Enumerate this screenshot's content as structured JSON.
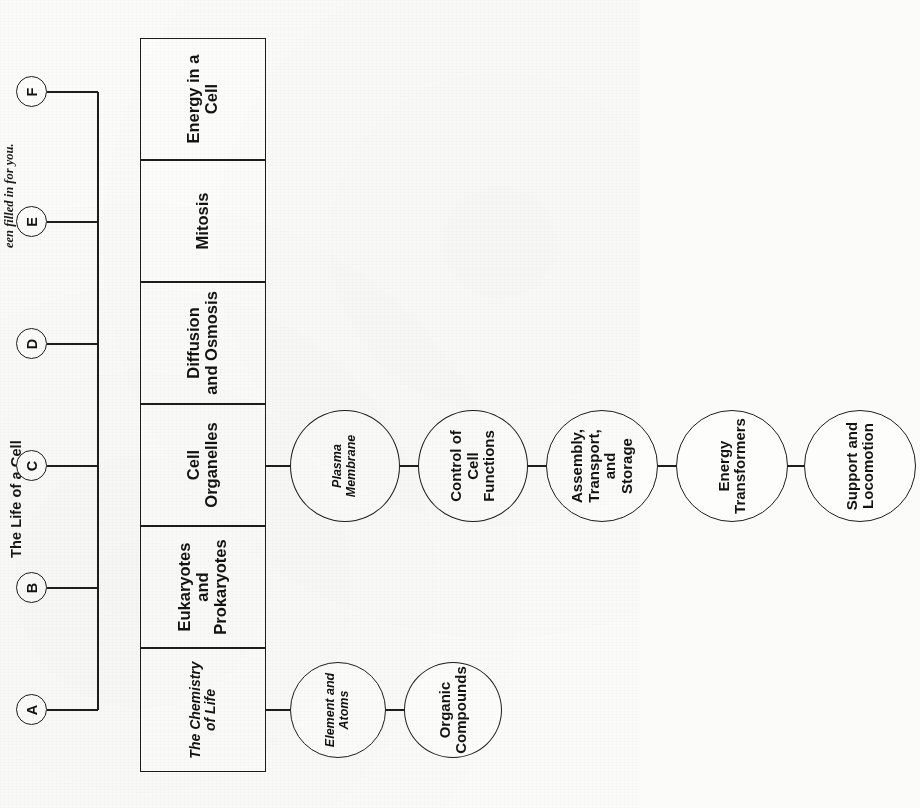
{
  "worksheet": {
    "title": "The Life of a Cell",
    "instruction": "een filled in for you."
  },
  "trunk": {
    "letters": [
      {
        "id": "A",
        "label": "A"
      },
      {
        "id": "B",
        "label": "B"
      },
      {
        "id": "C",
        "label": "C"
      },
      {
        "id": "D",
        "label": "D"
      },
      {
        "id": "E",
        "label": "E"
      },
      {
        "id": "F",
        "label": "F"
      }
    ]
  },
  "main_boxes": [
    {
      "id": "A",
      "label": "The Chemistry\nof Life",
      "prefilled": true
    },
    {
      "id": "B",
      "label": "Eukaryotes\nand\nProkaryotes",
      "prefilled": false
    },
    {
      "id": "C",
      "label": "Cell\nOrganelles",
      "prefilled": false
    },
    {
      "id": "D",
      "label": "Diffusion\nand Osmosis",
      "prefilled": false
    },
    {
      "id": "E",
      "label": "Mitosis",
      "prefilled": false
    },
    {
      "id": "F",
      "label": "Energy in a\nCell",
      "prefilled": false
    }
  ],
  "branches": [
    {
      "parent": "A",
      "nodes": [
        {
          "label": "Element and\nAtoms",
          "prefilled": false
        },
        {
          "label": "Organic\nCompounds",
          "prefilled": false
        }
      ]
    },
    {
      "parent": "C",
      "nodes": [
        {
          "label": "Plasma\nMembrane",
          "prefilled": true
        },
        {
          "label": "Control of\nCell Functions",
          "prefilled": false
        },
        {
          "label": "Assembly,\nTransport, and\nStorage",
          "prefilled": false
        },
        {
          "label": "Energy\nTransformers",
          "prefilled": false
        },
        {
          "label": "Support and\nLocomotion",
          "prefilled": false
        }
      ]
    }
  ],
  "colors": {
    "ink": "#1d1d1d",
    "paper": "#fbfbfa",
    "fill": "#fdfdfc"
  }
}
